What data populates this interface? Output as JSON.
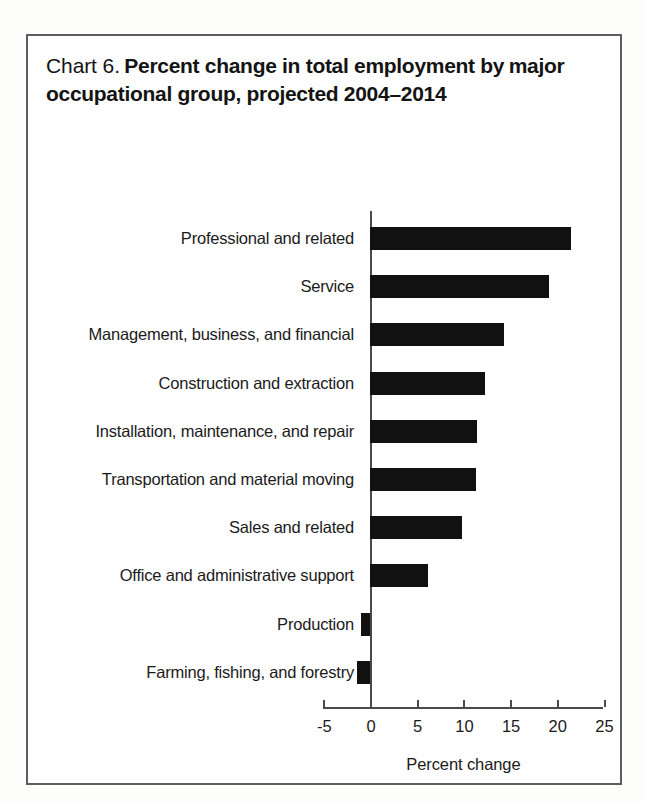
{
  "figure": {
    "label": "Chart 6.",
    "title": "Percent change in total employment by major occupational group, projected 2004–2014",
    "title_line1": "Percent change in total employment by",
    "title_line2": "major occupational group, projected 2004–2014"
  },
  "chart_data": {
    "type": "bar",
    "orientation": "horizontal",
    "title": "Chart 6. Percent change in total employment by major occupational group, projected 2004–2014",
    "xlabel": "Percent change",
    "ylabel": "",
    "xlim": [
      -5,
      25
    ],
    "xticks": [
      -5,
      0,
      5,
      10,
      15,
      20,
      25
    ],
    "xtick_labels": [
      "-5",
      "0",
      "5",
      "10",
      "15",
      "20",
      "25"
    ],
    "grid": false,
    "legend": false,
    "bar_color": "#111111",
    "axis_color": "#4a4a4a",
    "categories": [
      "Professional and related",
      "Service",
      "Management, business, and financial",
      "Construction and extraction",
      "Installation, maintenance, and repair",
      "Transportation and material moving",
      "Sales and related",
      "Office and administrative support",
      "Production",
      "Farming, fishing, and forestry"
    ],
    "values": [
      21.5,
      19.2,
      14.4,
      12.3,
      11.5,
      11.4,
      9.9,
      6.2,
      -1.0,
      -1.4
    ]
  }
}
